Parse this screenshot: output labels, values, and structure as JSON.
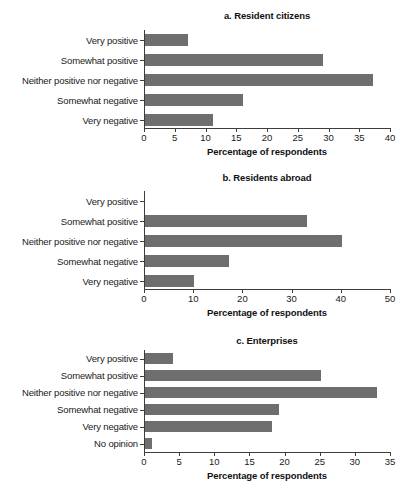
{
  "figure": {
    "background": "#ffffff",
    "bar_color": "#6e6e6e",
    "axis_color": "#3d3d3d"
  },
  "chart_data": [
    {
      "type": "bar",
      "orientation": "horizontal",
      "title": "a. Resident citizens",
      "categories": [
        "Very positive",
        "Somewhat positive",
        "Neither positive nor negative",
        "Somewhat negative",
        "Very negative"
      ],
      "values": [
        7,
        29,
        37,
        16,
        11
      ],
      "xlabel": "Percentage of respondents",
      "ylabel": "",
      "xlim": [
        0,
        40
      ],
      "xticks": [
        0,
        5,
        10,
        15,
        20,
        25,
        30,
        35,
        40
      ],
      "xticklabels": [
        "0",
        "5",
        "10",
        "15",
        "20",
        "25",
        "30",
        "35",
        "40"
      ],
      "grid": false,
      "legend": null
    },
    {
      "type": "bar",
      "orientation": "horizontal",
      "title": "b. Residents abroad",
      "categories": [
        "Very positive",
        "Somewhat positive",
        "Neither positive nor negative",
        "Somewhat negative",
        "Very negative"
      ],
      "values": [
        0,
        33,
        40,
        17,
        10
      ],
      "xlabel": "Percentage of respondents",
      "ylabel": "",
      "xlim": [
        0,
        50
      ],
      "xticks": [
        0,
        10,
        20,
        30,
        40,
        50
      ],
      "xticklabels": [
        "0",
        "10",
        "20",
        "30",
        "40",
        "50"
      ],
      "grid": false,
      "legend": null
    },
    {
      "type": "bar",
      "orientation": "horizontal",
      "title": "c. Enterprises",
      "categories": [
        "Very positive",
        "Somewhat positive",
        "Neither positive nor negative",
        "Somewhat negative",
        "Very negative",
        "No opinion"
      ],
      "values": [
        4,
        25,
        33,
        19,
        18,
        1
      ],
      "xlabel": "Percentage of respondents",
      "ylabel": "",
      "xlim": [
        0,
        35
      ],
      "xticks": [
        0,
        5,
        10,
        15,
        20,
        25,
        30,
        35
      ],
      "xticklabels": [
        "0",
        "5",
        "10",
        "15",
        "20",
        "25",
        "30",
        "35"
      ],
      "grid": false,
      "legend": null
    }
  ]
}
